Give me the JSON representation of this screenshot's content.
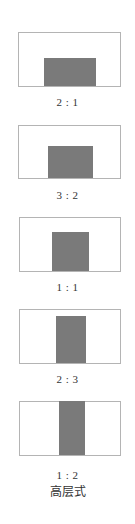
{
  "diagram": {
    "title": "高层式",
    "colors": {
      "frame_border": "#b4b4b4",
      "fill": "#7a7a7a",
      "text": "#333333"
    },
    "items": [
      {
        "ratio_label": "2 : 1"
      },
      {
        "ratio_label": "3 : 2"
      },
      {
        "ratio_label": "1 : 1"
      },
      {
        "ratio_label": "2 : 3"
      },
      {
        "ratio_label": "1 : 2"
      }
    ]
  }
}
